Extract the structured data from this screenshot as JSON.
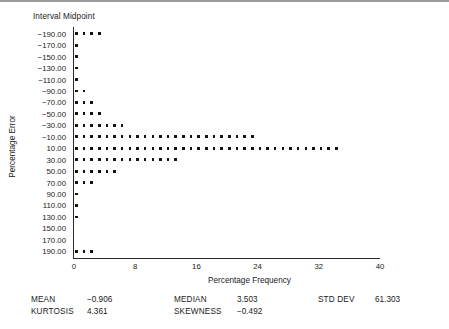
{
  "figure": {
    "header_label": "Interval Midpoint",
    "y_title": "Percentage Error",
    "x_title": "Percentage Frequency"
  },
  "stats": {
    "mean_label": "MEAN",
    "mean_value": "−0.906",
    "kurtosis_label": "KURTOSIS",
    "kurtosis_value": "4.361",
    "median_label": "MEDIAN",
    "median_value": "3.503",
    "skewness_label": "SKEWNESS",
    "skewness_value": "−0.492",
    "stddev_label": "STD DEV",
    "stddev_value": "61.303"
  },
  "chart_data": {
    "type": "bar",
    "orientation": "horizontal",
    "style": "dot-plot histogram",
    "title": "",
    "xlabel": "Percentage Frequency",
    "ylabel": "Percentage Error",
    "header_label": "Interval Midpoint",
    "xlim": [
      0,
      40
    ],
    "xticks": [
      0,
      8,
      16,
      24,
      32,
      40
    ],
    "xticklabels": [
      "0",
      "8",
      "16",
      "24",
      "32",
      "40"
    ],
    "grid": false,
    "legend": "none",
    "dot_unit": 1,
    "categories": [
      "−190.00",
      "−170.00",
      "−150.00",
      "−130.00",
      "−110.00",
      "−90.00",
      "−70.00",
      "−50.00",
      "−30.00",
      "−10.00",
      "10.00",
      "30.00",
      "50.00",
      "70.00",
      "90.00",
      "110.00",
      "130.00",
      "150.00",
      "170.00",
      "190.00"
    ],
    "values": [
      4,
      1,
      1,
      1,
      1,
      2,
      3,
      4,
      7,
      24,
      35,
      14,
      6,
      3,
      1,
      1,
      1,
      0,
      0,
      3
    ],
    "annotations": [
      "MEAN −0.906",
      "MEDIAN 3.503",
      "STD DEV 61.303",
      "KURTOSIS 4.361",
      "SKEWNESS −0.492"
    ]
  }
}
